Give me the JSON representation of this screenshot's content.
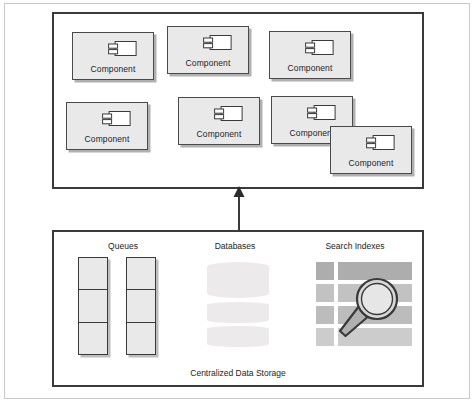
{
  "diagram": {
    "components_container": {
      "name": "components-container",
      "components": [
        {
          "label": "Component"
        },
        {
          "label": "Component"
        },
        {
          "label": "Component"
        },
        {
          "label": "Component"
        },
        {
          "label": "Component"
        },
        {
          "label": "Component"
        },
        {
          "label": "Component"
        }
      ]
    },
    "arrow": {
      "name": "upward-arrow",
      "direction": "up",
      "from": "storage-container",
      "to": "components-container"
    },
    "storage_container": {
      "caption": "Centralized Data Storage",
      "groups": [
        {
          "key": "queues",
          "label": "Queues",
          "icon": "queue-stack-icon",
          "stacks": 2,
          "cells_per_stack": 3
        },
        {
          "key": "databases",
          "label": "Databases",
          "icon": "database-cylinder-icon",
          "cylinders": 3
        },
        {
          "key": "search_indexes",
          "label": "Search Indexes",
          "icon": "magnifier-icon",
          "grid_rows": 4,
          "grid_cols": 2
        }
      ]
    }
  },
  "colors": {
    "component_fill": "#e9e9e9",
    "component_stroke": "#4a4a4a",
    "container_stroke": "#3a3a3a",
    "grid_cell": "#bfbfbf",
    "database_fill": "#eceaea",
    "page_frame": "#c9c9c9",
    "text": "#232323"
  }
}
